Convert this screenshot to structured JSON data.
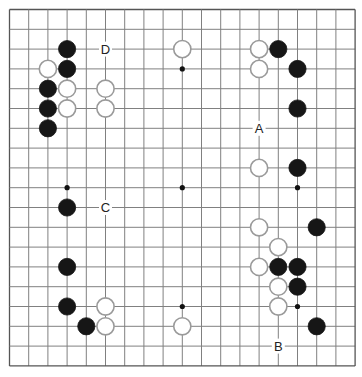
{
  "diagram": {
    "board_size": 19,
    "grid": {
      "origin_x": 9.5,
      "origin_y": 9.5,
      "step_x": 19.2,
      "step_y": 19.8,
      "line_color": "#808080",
      "edge_color": "#555555"
    },
    "stone_radius": 8.6,
    "colors": {
      "black_fill": "#161616",
      "white_fill": "#ffffff",
      "white_stroke": "#9a9a9a",
      "hoshi": "#111111",
      "label_bg": "#ffffff"
    },
    "hoshi": [
      {
        "col": 3,
        "row": 3
      },
      {
        "col": 9,
        "row": 3
      },
      {
        "col": 15,
        "row": 3
      },
      {
        "col": 3,
        "row": 9
      },
      {
        "col": 9,
        "row": 9
      },
      {
        "col": 15,
        "row": 9
      },
      {
        "col": 3,
        "row": 15
      },
      {
        "col": 9,
        "row": 15
      },
      {
        "col": 15,
        "row": 15
      }
    ],
    "stones": [
      {
        "color": "black",
        "col": 3,
        "row": 2
      },
      {
        "color": "white",
        "col": 2,
        "row": 3
      },
      {
        "color": "black",
        "col": 3,
        "row": 3
      },
      {
        "color": "black",
        "col": 2,
        "row": 4
      },
      {
        "color": "white",
        "col": 3,
        "row": 4
      },
      {
        "color": "white",
        "col": 5,
        "row": 4
      },
      {
        "color": "black",
        "col": 2,
        "row": 5
      },
      {
        "color": "white",
        "col": 3,
        "row": 5
      },
      {
        "color": "white",
        "col": 5,
        "row": 5
      },
      {
        "color": "black",
        "col": 2,
        "row": 6
      },
      {
        "color": "white",
        "col": 9,
        "row": 2
      },
      {
        "color": "white",
        "col": 13,
        "row": 2
      },
      {
        "color": "black",
        "col": 14,
        "row": 2
      },
      {
        "color": "white",
        "col": 13,
        "row": 3
      },
      {
        "color": "black",
        "col": 15,
        "row": 3
      },
      {
        "color": "black",
        "col": 15,
        "row": 5
      },
      {
        "color": "white",
        "col": 13,
        "row": 8
      },
      {
        "color": "black",
        "col": 15,
        "row": 8
      },
      {
        "color": "black",
        "col": 3,
        "row": 10
      },
      {
        "color": "white",
        "col": 13,
        "row": 11
      },
      {
        "color": "black",
        "col": 16,
        "row": 11
      },
      {
        "color": "white",
        "col": 14,
        "row": 12
      },
      {
        "color": "white",
        "col": 13,
        "row": 13
      },
      {
        "color": "black",
        "col": 14,
        "row": 13
      },
      {
        "color": "black",
        "col": 15,
        "row": 13
      },
      {
        "color": "white",
        "col": 14,
        "row": 14
      },
      {
        "color": "black",
        "col": 15,
        "row": 14
      },
      {
        "color": "white",
        "col": 14,
        "row": 15
      },
      {
        "color": "black",
        "col": 16,
        "row": 16
      },
      {
        "color": "black",
        "col": 3,
        "row": 13
      },
      {
        "color": "black",
        "col": 3,
        "row": 15
      },
      {
        "color": "white",
        "col": 5,
        "row": 15
      },
      {
        "color": "black",
        "col": 4,
        "row": 16
      },
      {
        "color": "white",
        "col": 5,
        "row": 16
      },
      {
        "color": "white",
        "col": 9,
        "row": 16
      }
    ],
    "labels": [
      {
        "text": "D",
        "col": 5,
        "row": 2
      },
      {
        "text": "A",
        "col": 13,
        "row": 6
      },
      {
        "text": "C",
        "col": 5,
        "row": 10
      },
      {
        "text": "B",
        "col": 14,
        "row": 17
      }
    ]
  }
}
